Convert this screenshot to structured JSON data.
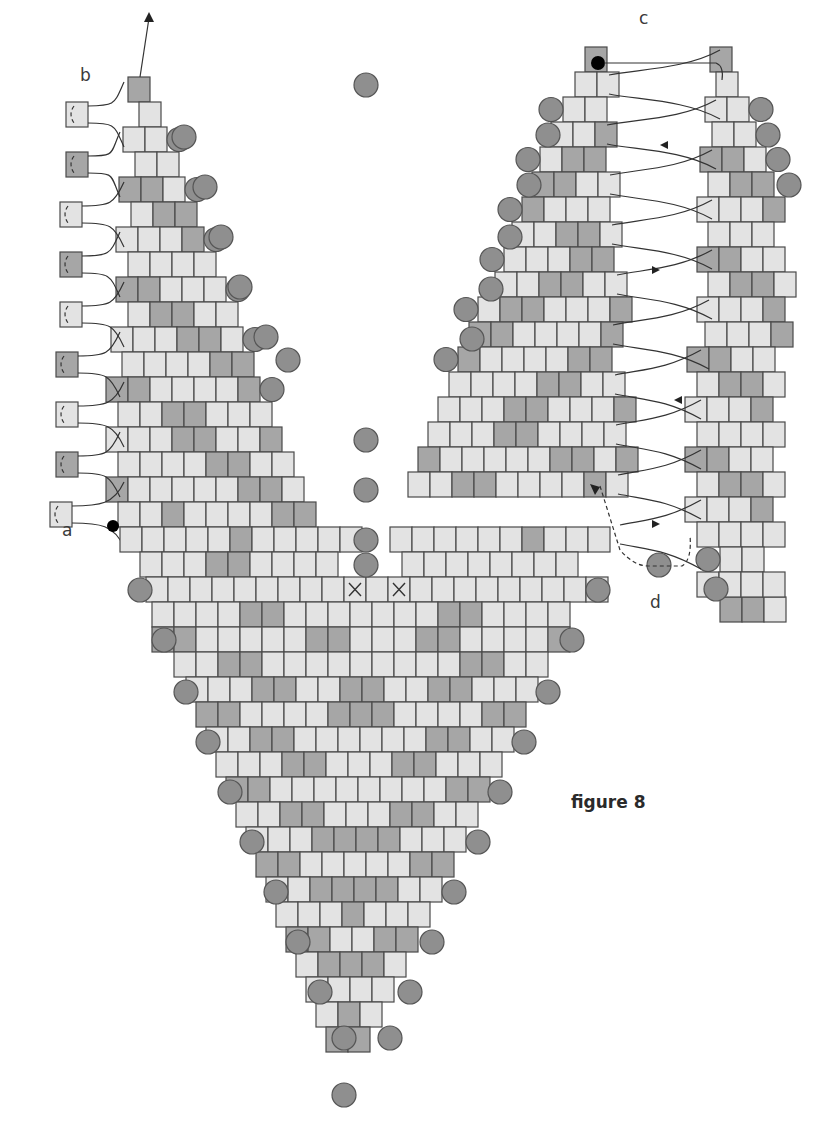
{
  "figure": {
    "caption": "figure 8",
    "labels": {
      "a": "a",
      "b": "b",
      "c": "c",
      "d": "d"
    }
  },
  "colors": {
    "light": "#e3e3e3",
    "mid": "#c8c8c8",
    "dark": "#a6a6a6",
    "round": "#8f8f8f",
    "stroke": "#4a4a4a",
    "thread": "#333333",
    "start_dot": "#000000"
  },
  "bead": {
    "w": 22,
    "h": 25,
    "round_r": 12
  },
  "left_panel": {
    "rows": [
      {
        "x": 128,
        "y": 77,
        "p": "D"
      },
      {
        "x": 139,
        "y": 102,
        "p": "L"
      },
      {
        "x": 123,
        "y": 127,
        "p": "LL",
        "r": "R"
      },
      {
        "x": 135,
        "y": 152,
        "p": "LL"
      },
      {
        "x": 119,
        "y": 177,
        "p": "DDL",
        "r": "R"
      },
      {
        "x": 131,
        "y": 202,
        "p": "LDD"
      },
      {
        "x": 116,
        "y": 227,
        "p": "LLLD",
        "r": "R"
      },
      {
        "x": 128,
        "y": 252,
        "p": "LLLL"
      },
      {
        "x": 116,
        "y": 277,
        "p": "DDLLL",
        "r": "R"
      },
      {
        "x": 128,
        "y": 302,
        "p": "LDDLL"
      },
      {
        "x": 111,
        "y": 327,
        "p": "LLLDDL",
        "r": "R"
      },
      {
        "x": 122,
        "y": 352,
        "p": "LLLLDD"
      },
      {
        "x": 106,
        "y": 377,
        "p": "DDLLLLD",
        "r": "R"
      },
      {
        "x": 118,
        "y": 402,
        "p": "LLDDLLL"
      },
      {
        "x": 106,
        "y": 427,
        "p": "LLLDDLLD"
      },
      {
        "x": 118,
        "y": 452,
        "p": "LLLLDDLL"
      },
      {
        "x": 106,
        "y": 477,
        "p": "DLLLLLDDL"
      },
      {
        "x": 118,
        "y": 502,
        "p": "LLDLLLLDD"
      }
    ],
    "side_beads": [
      {
        "x": 66,
        "y": 102,
        "c": "L"
      },
      {
        "x": 66,
        "y": 152,
        "c": "D"
      },
      {
        "x": 60,
        "y": 202,
        "c": "L"
      },
      {
        "x": 60,
        "y": 252,
        "c": "D"
      },
      {
        "x": 60,
        "y": 302,
        "c": "L"
      },
      {
        "x": 56,
        "y": 352,
        "c": "D"
      },
      {
        "x": 56,
        "y": 402,
        "c": "L"
      },
      {
        "x": 56,
        "y": 452,
        "c": "D"
      },
      {
        "x": 50,
        "y": 502,
        "c": "L"
      }
    ]
  },
  "right_panel": {
    "rows": [
      {
        "x": 585,
        "y": 47,
        "p": "D"
      },
      {
        "x": 575,
        "y": 72,
        "p": "LL"
      },
      {
        "x": 563,
        "y": 97,
        "p": "LL",
        "l": "R"
      },
      {
        "x": 551,
        "y": 122,
        "p": "LLD"
      },
      {
        "x": 540,
        "y": 147,
        "p": "LDD",
        "l": "R"
      },
      {
        "x": 532,
        "y": 172,
        "p": "DDLL"
      },
      {
        "x": 522,
        "y": 197,
        "p": "DLLL",
        "l": "R"
      },
      {
        "x": 512,
        "y": 222,
        "p": "LLDDL"
      },
      {
        "x": 504,
        "y": 247,
        "p": "LLLDD",
        "l": "R"
      },
      {
        "x": 495,
        "y": 272,
        "p": "LLDDLL"
      },
      {
        "x": 478,
        "y": 297,
        "p": "LDDLLLD",
        "l": "R"
      },
      {
        "x": 469,
        "y": 322,
        "p": "DDLLLLD"
      },
      {
        "x": 458,
        "y": 347,
        "p": "DLLLLDD",
        "l": "R"
      },
      {
        "x": 449,
        "y": 372,
        "p": "LLLLDDLL"
      },
      {
        "x": 438,
        "y": 397,
        "p": "LLLDDLLLD"
      },
      {
        "x": 428,
        "y": 422,
        "p": "LLLDDLLLL"
      },
      {
        "x": 418,
        "y": 447,
        "p": "DLLLLLDDLD"
      },
      {
        "x": 408,
        "y": 472,
        "p": "LLDDLLLLDL"
      }
    ],
    "far_rows": [
      {
        "x": 710,
        "y": 47,
        "p": "D"
      },
      {
        "x": 716,
        "y": 72,
        "p": "L"
      },
      {
        "x": 705,
        "y": 97,
        "p": "LL",
        "r": "R"
      },
      {
        "x": 712,
        "y": 122,
        "p": "LL"
      },
      {
        "x": 700,
        "y": 147,
        "p": "DDL",
        "r": "R"
      },
      {
        "x": 708,
        "y": 172,
        "p": "LDD"
      },
      {
        "x": 697,
        "y": 197,
        "p": "LLLD"
      },
      {
        "x": 708,
        "y": 222,
        "p": "LLL"
      },
      {
        "x": 697,
        "y": 247,
        "p": "DDLL"
      },
      {
        "x": 708,
        "y": 272,
        "p": "LDDL"
      },
      {
        "x": 697,
        "y": 297,
        "p": "LLLD"
      },
      {
        "x": 705,
        "y": 322,
        "p": "LLLD"
      },
      {
        "x": 687,
        "y": 347,
        "p": "DDLL"
      },
      {
        "x": 697,
        "y": 372,
        "p": "LDDL"
      },
      {
        "x": 685,
        "y": 397,
        "p": "LLLD"
      },
      {
        "x": 697,
        "y": 422,
        "p": "LLLL"
      },
      {
        "x": 685,
        "y": 447,
        "p": "DDLL"
      },
      {
        "x": 697,
        "y": 472,
        "p": "LDDL"
      },
      {
        "x": 685,
        "y": 497,
        "p": "LLLD"
      },
      {
        "x": 697,
        "y": 522,
        "p": "LLLL"
      },
      {
        "x": 720,
        "y": 547,
        "p": "LL",
        "l": "R"
      },
      {
        "x": 720,
        "y": 597,
        "p": "DDL"
      },
      {
        "x": 697,
        "y": 572,
        "p": "LLLL"
      }
    ]
  },
  "v_panel": {
    "rows": [
      {
        "x": 120,
        "y": 527,
        "n": 11,
        "p": "LLLLLDLLLLL"
      },
      {
        "x": 390,
        "y": 527,
        "n": 10,
        "p": "LLLLLLDLLL"
      },
      {
        "x": 140,
        "y": 552,
        "n": 9,
        "p": "LLLDDLLLL"
      },
      {
        "x": 402,
        "y": 552,
        "n": 8,
        "p": "LLLLLLLL"
      },
      {
        "x": 146,
        "y": 577,
        "n": 21,
        "p": "LLLLLLLLLXLXLLLLLLLLL"
      },
      {
        "x": 152,
        "y": 602,
        "n": 19,
        "p": "LLLLDDLLLLLLLDDLLLL"
      },
      {
        "x": 152,
        "y": 627,
        "n": 19,
        "p": "DDLLLLLDDLLLDDLLLLD"
      },
      {
        "x": 174,
        "y": 652,
        "n": 17,
        "p": "LLDDLLLLLLLLLDDLL"
      },
      {
        "x": 186,
        "y": 677,
        "n": 16,
        "p": "LLLDDLLDDLLDDLLL"
      },
      {
        "x": 196,
        "y": 702,
        "n": 15,
        "p": "DDLLLLDDDLLLLDD"
      },
      {
        "x": 206,
        "y": 727,
        "n": 14,
        "p": "LLDDLLLLLLDDLL"
      },
      {
        "x": 216,
        "y": 752,
        "n": 13,
        "p": "LLLDDLLLDDLLL"
      },
      {
        "x": 226,
        "y": 777,
        "n": 12,
        "p": "DDLLLLLLLLDD"
      },
      {
        "x": 236,
        "y": 802,
        "n": 11,
        "p": "LLDDLLLDDLL"
      },
      {
        "x": 246,
        "y": 827,
        "n": 10,
        "p": "LLLDDDDLLL"
      },
      {
        "x": 256,
        "y": 852,
        "n": 9,
        "p": "DDLLLLLDD"
      },
      {
        "x": 266,
        "y": 877,
        "n": 8,
        "p": "LLDDDDLL"
      },
      {
        "x": 276,
        "y": 902,
        "n": 7,
        "p": "LLLDLLL"
      },
      {
        "x": 286,
        "y": 927,
        "n": 6,
        "p": "DDLLDD"
      },
      {
        "x": 296,
        "y": 952,
        "n": 5,
        "p": "LDDDL"
      },
      {
        "x": 306,
        "y": 977,
        "n": 4,
        "p": "LLLL"
      },
      {
        "x": 316,
        "y": 1002,
        "n": 3,
        "p": "LDL"
      },
      {
        "x": 326,
        "y": 1027,
        "n": 2,
        "p": "DD"
      }
    ],
    "round_left": [
      {
        "x": 140,
        "y": 590
      },
      {
        "x": 164,
        "y": 640
      },
      {
        "x": 186,
        "y": 692
      },
      {
        "x": 208,
        "y": 742
      },
      {
        "x": 230,
        "y": 792
      },
      {
        "x": 252,
        "y": 842
      },
      {
        "x": 276,
        "y": 892
      },
      {
        "x": 298,
        "y": 942
      },
      {
        "x": 320,
        "y": 992
      },
      {
        "x": 344,
        "y": 1038
      },
      {
        "x": 344,
        "y": 1095
      }
    ],
    "round_right": [
      {
        "x": 598,
        "y": 590
      },
      {
        "x": 572,
        "y": 640
      },
      {
        "x": 548,
        "y": 692
      },
      {
        "x": 524,
        "y": 742
      },
      {
        "x": 500,
        "y": 792
      },
      {
        "x": 478,
        "y": 842
      },
      {
        "x": 454,
        "y": 892
      },
      {
        "x": 432,
        "y": 942
      },
      {
        "x": 410,
        "y": 992
      },
      {
        "x": 390,
        "y": 1038
      }
    ]
  },
  "center_round_beads": [
    {
      "x": 366,
      "y": 85
    },
    {
      "x": 366,
      "y": 440
    },
    {
      "x": 366,
      "y": 490
    },
    {
      "x": 366,
      "y": 540
    },
    {
      "x": 366,
      "y": 565
    }
  ],
  "left_round_beads": [
    {
      "x": 184,
      "y": 137
    },
    {
      "x": 205,
      "y": 187
    },
    {
      "x": 221,
      "y": 237
    },
    {
      "x": 240,
      "y": 287
    },
    {
      "x": 266,
      "y": 337
    },
    {
      "x": 288,
      "y": 360
    }
  ],
  "right_round_beads": [
    {
      "x": 548,
      "y": 135
    },
    {
      "x": 529,
      "y": 185
    },
    {
      "x": 510,
      "y": 237
    },
    {
      "x": 491,
      "y": 289
    },
    {
      "x": 472,
      "y": 339
    },
    {
      "x": 768,
      "y": 135
    },
    {
      "x": 789,
      "y": 185
    },
    {
      "x": 659,
      "y": 565
    },
    {
      "x": 716,
      "y": 589
    }
  ]
}
